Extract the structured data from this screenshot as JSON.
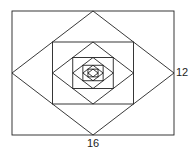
{
  "figure": {
    "outer_rect": {
      "x": 12,
      "y": 11,
      "width": 162,
      "height": 124
    },
    "levels": 5,
    "stroke": "#222222",
    "labels": {
      "width_label": "16",
      "height_label": "12"
    }
  }
}
